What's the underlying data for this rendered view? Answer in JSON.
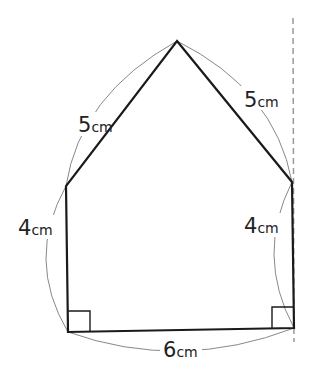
{
  "figure": {
    "type": "pentagon-with-dimensions",
    "vertices": {
      "top": [
        177,
        41
      ],
      "upper_left": [
        66,
        186
      ],
      "upper_right": [
        292,
        182
      ],
      "bottom_left": [
        68,
        332
      ],
      "bottom_right": [
        294,
        328
      ]
    },
    "colors": {
      "edge": "#1a1a1a",
      "arc": "#888888",
      "dashed_line": "#999999",
      "text": "#222222"
    }
  },
  "labels": {
    "left_slant": {
      "num": "5",
      "unit": "cm"
    },
    "right_slant": {
      "num": "5",
      "unit": "cm"
    },
    "left_side": {
      "num": "4",
      "unit": "cm"
    },
    "right_side": {
      "num": "4",
      "unit": "cm"
    },
    "bottom": {
      "num": "6",
      "unit": "cm"
    }
  },
  "right_angle_marks": [
    "bottom_left",
    "bottom_right"
  ]
}
